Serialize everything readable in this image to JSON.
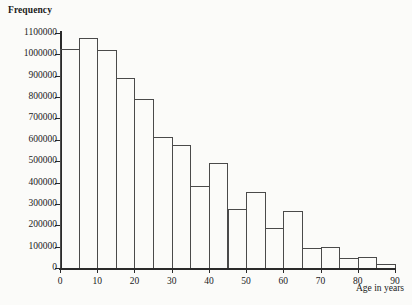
{
  "figure": {
    "y_axis_title": "Frequency",
    "x_axis_title": "Age in years"
  },
  "chart_data": {
    "type": "bar",
    "title": "",
    "subtitle": "",
    "xlabel": "Age in years",
    "ylabel": "Frequency",
    "xlim": [
      0,
      90
    ],
    "ylim": [
      0,
      1100000
    ],
    "grid": false,
    "legend": null,
    "bin_width": 5,
    "x_ticks": [
      0,
      10,
      20,
      30,
      40,
      50,
      60,
      70,
      80,
      90
    ],
    "x_tick_labels": [
      "0",
      "10",
      "20",
      "30",
      "40",
      "50",
      "60",
      "70",
      "80",
      "90"
    ],
    "y_ticks": [
      0,
      100000,
      200000,
      300000,
      400000,
      500000,
      600000,
      700000,
      800000,
      900000,
      1000000,
      1100000
    ],
    "y_tick_labels": [
      "0",
      "100000",
      "200000",
      "300000",
      "400000",
      "500000",
      "600000",
      "700000",
      "800000",
      "900000",
      "1000000",
      "1100000"
    ],
    "categories": [
      "0-5",
      "5-10",
      "10-15",
      "15-20",
      "20-25",
      "25-30",
      "30-35",
      "35-40",
      "40-45",
      "45-50",
      "50-55",
      "55-60",
      "60-65",
      "65-70",
      "70-75",
      "75-80",
      "80-85",
      "85-90"
    ],
    "bin_edges": [
      0,
      5,
      10,
      15,
      20,
      25,
      30,
      35,
      40,
      45,
      50,
      55,
      60,
      65,
      70,
      75,
      80,
      85,
      90
    ],
    "values": [
      1025000,
      1075000,
      1020000,
      890000,
      790000,
      615000,
      575000,
      385000,
      490000,
      275000,
      355000,
      185000,
      265000,
      95000,
      100000,
      45000,
      50000,
      20000
    ]
  }
}
